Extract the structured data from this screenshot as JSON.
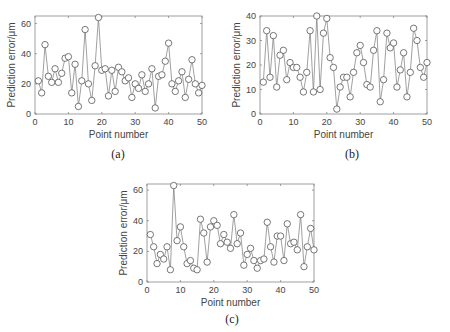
{
  "figure": {
    "panels": [
      "(a)",
      "(b)",
      "(c)"
    ]
  },
  "chart_data": [
    {
      "type": "line",
      "panel_label": "(a)",
      "title": "",
      "xlabel": "Point number",
      "ylabel": "Prediction error/μm",
      "xlim": [
        0,
        50
      ],
      "ylim": [
        0,
        65
      ],
      "xticks": [
        0,
        10,
        20,
        30,
        40,
        50
      ],
      "yticks": [
        0,
        20,
        40,
        60
      ],
      "grid": false,
      "marker": "circle",
      "x": [
        1,
        2,
        3,
        4,
        5,
        6,
        7,
        8,
        9,
        10,
        11,
        12,
        13,
        14,
        15,
        16,
        17,
        18,
        19,
        20,
        21,
        22,
        23,
        24,
        25,
        26,
        27,
        28,
        29,
        30,
        31,
        32,
        33,
        34,
        35,
        36,
        37,
        38,
        39,
        40,
        41,
        42,
        43,
        44,
        45,
        46,
        47,
        48,
        49,
        50
      ],
      "series": [
        {
          "name": "Prediction error",
          "values": [
            22,
            14,
            46,
            25,
            21,
            30,
            21,
            27,
            37,
            38,
            14,
            33,
            5,
            22,
            56,
            20,
            9,
            32,
            64,
            29,
            30,
            12,
            29,
            15,
            31,
            28,
            22,
            24,
            11,
            20,
            17,
            26,
            15,
            20,
            30,
            4,
            25,
            26,
            35,
            47,
            20,
            15,
            22,
            28,
            11,
            23,
            36,
            20,
            14,
            19
          ]
        }
      ]
    },
    {
      "type": "line",
      "panel_label": "(b)",
      "title": "",
      "xlabel": "Point number",
      "ylabel": "Prediction error/μm",
      "xlim": [
        0,
        50
      ],
      "ylim": [
        0,
        40
      ],
      "xticks": [
        0,
        10,
        20,
        30,
        40,
        50
      ],
      "yticks": [
        0,
        10,
        20,
        30,
        40
      ],
      "grid": false,
      "marker": "circle",
      "x": [
        1,
        2,
        3,
        4,
        5,
        6,
        7,
        8,
        9,
        10,
        11,
        12,
        13,
        14,
        15,
        16,
        17,
        18,
        19,
        20,
        21,
        22,
        23,
        24,
        25,
        26,
        27,
        28,
        29,
        30,
        31,
        32,
        33,
        34,
        35,
        36,
        37,
        38,
        39,
        40,
        41,
        42,
        43,
        44,
        45,
        46,
        47,
        48,
        49,
        50
      ],
      "series": [
        {
          "name": "Prediction error",
          "values": [
            13,
            34,
            15,
            32,
            11,
            24,
            26,
            14,
            21,
            19,
            19,
            15,
            9,
            17,
            34,
            9,
            40,
            10,
            33,
            39,
            23,
            19,
            2,
            11,
            15,
            15,
            7,
            17,
            25,
            28,
            21,
            12,
            11,
            26,
            34,
            5,
            14,
            33,
            27,
            29,
            11,
            18,
            25,
            7,
            17,
            35,
            30,
            19,
            15,
            21
          ]
        }
      ]
    },
    {
      "type": "line",
      "panel_label": "(c)",
      "title": "",
      "xlabel": "Point number",
      "ylabel": "Prediction error/μm",
      "xlim": [
        0,
        50
      ],
      "ylim": [
        0,
        64
      ],
      "xticks": [
        0,
        10,
        20,
        30,
        40,
        50
      ],
      "yticks": [
        0,
        20,
        40,
        60
      ],
      "grid": false,
      "marker": "circle",
      "x": [
        1,
        2,
        3,
        4,
        5,
        6,
        7,
        8,
        9,
        10,
        11,
        12,
        13,
        14,
        15,
        16,
        17,
        18,
        19,
        20,
        21,
        22,
        23,
        24,
        25,
        26,
        27,
        28,
        29,
        30,
        31,
        32,
        33,
        34,
        35,
        36,
        37,
        38,
        39,
        40,
        41,
        42,
        43,
        44,
        45,
        46,
        47,
        48,
        49,
        50
      ],
      "series": [
        {
          "name": "Prediction error",
          "values": [
            31,
            23,
            12,
            18,
            15,
            23,
            8,
            63,
            27,
            36,
            23,
            12,
            14,
            9,
            8,
            41,
            32,
            13,
            36,
            40,
            37,
            25,
            31,
            26,
            22,
            44,
            25,
            32,
            11,
            18,
            22,
            14,
            9,
            14,
            15,
            39,
            23,
            13,
            30,
            30,
            14,
            38,
            25,
            26,
            21,
            44,
            10,
            23,
            35,
            21
          ]
        }
      ]
    }
  ]
}
